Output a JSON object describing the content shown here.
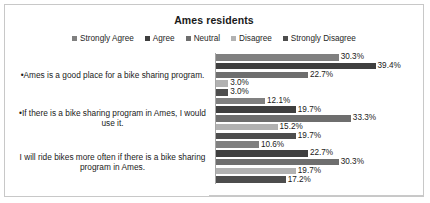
{
  "chart_data": {
    "type": "bar",
    "orientation": "horizontal",
    "title": "Ames residents",
    "xlabel": "",
    "ylabel": "",
    "grid": false,
    "legend_position": "top",
    "value_suffix": "%",
    "xlim": [
      0,
      45
    ],
    "categories": [
      "•Ames is a good place for a bike sharing program.",
      "•If there is a bike sharing program in Ames, I would use it.",
      "I will ride bikes more often if there is a bike sharing program in Ames."
    ],
    "series": [
      {
        "name": "Strongly Agree",
        "color": "#808080",
        "values": [
          30.3,
          12.1,
          10.6
        ],
        "labels": [
          "30.3%",
          "12.1%",
          "10.6%"
        ]
      },
      {
        "name": "Agree",
        "color": "#3f3f3f",
        "values": [
          39.4,
          19.7,
          22.7
        ],
        "labels": [
          "39.4%",
          "19.7%",
          "22.7%"
        ]
      },
      {
        "name": "Neutral",
        "color": "#6e6e6e",
        "values": [
          22.7,
          33.3,
          30.3
        ],
        "labels": [
          "22.7%",
          "33.3%",
          "30.3%"
        ]
      },
      {
        "name": "Disagree",
        "color": "#b2b2b2",
        "values": [
          3.0,
          15.2,
          19.7
        ],
        "labels": [
          "3.0%",
          "15.2%",
          "19.7%"
        ]
      },
      {
        "name": "Strongly Disagree",
        "color": "#4d4d4d",
        "values": [
          3.0,
          19.7,
          17.2
        ],
        "labels": [
          "3.0%",
          "19.7%",
          "17.2%"
        ]
      }
    ]
  }
}
